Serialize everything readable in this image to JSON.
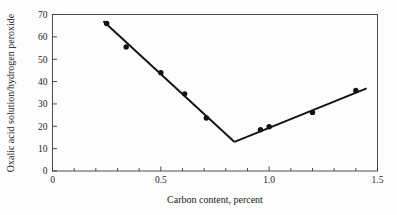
{
  "chart_data": {
    "type": "scatter",
    "title": "",
    "xlabel": "Carbon content, percent",
    "ylabel": "Oxalic acid solution/hydrogen peroxide",
    "xlim": [
      0,
      1.5
    ],
    "ylim": [
      0,
      70
    ],
    "grid": false,
    "legend": null,
    "x_major_ticks": [
      0,
      0.5,
      1.0,
      1.5
    ],
    "x_major_tick_labels": [
      "0",
      "0.5",
      "1.0",
      "1.5"
    ],
    "x_minor_ticks": [
      0.1,
      0.2,
      0.3,
      0.4,
      0.6,
      0.7,
      0.8,
      0.9,
      1.1,
      1.2,
      1.3,
      1.4
    ],
    "y_major_ticks": [
      0,
      10,
      20,
      30,
      40,
      50,
      60,
      70
    ],
    "y_major_tick_labels": [
      "0",
      "10",
      "20",
      "30",
      "40",
      "50",
      "60",
      "70"
    ],
    "points": [
      {
        "x": 0.25,
        "y": 66.0
      },
      {
        "x": 0.34,
        "y": 55.5
      },
      {
        "x": 0.5,
        "y": 44.0
      },
      {
        "x": 0.61,
        "y": 34.5
      },
      {
        "x": 0.71,
        "y": 23.7
      },
      {
        "x": 0.96,
        "y": 18.5
      },
      {
        "x": 1.0,
        "y": 19.8
      },
      {
        "x": 1.2,
        "y": 26.2
      },
      {
        "x": 1.4,
        "y": 36.0
      }
    ],
    "series": [
      {
        "name": "descending-fit",
        "type": "line",
        "x": [
          0.235,
          0.84
        ],
        "values": [
          67.0,
          13.0
        ]
      },
      {
        "name": "ascending-fit",
        "type": "line",
        "x": [
          0.84,
          1.45
        ],
        "values": [
          13.0,
          37.0
        ]
      }
    ],
    "vertex": {
      "x": 0.84,
      "y": 13.0
    },
    "marker_style": "filled-circle",
    "line_color": "#111111",
    "marker_color": "#111111",
    "frame_color": "#3a3a3a",
    "background_color": "#fdfdfd"
  }
}
